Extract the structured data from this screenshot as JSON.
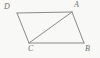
{
  "figure": {
    "type": "geometry-diagram",
    "shape": "parallelogram-with-diagonal",
    "background_color": "#f8f8f7",
    "stroke_color": "#8a8a8a",
    "label_color": "#6f6f6f",
    "stroke_width": 1,
    "width": 100,
    "height": 58,
    "vertices": [
      {
        "id": "D",
        "label": "D",
        "x": 17,
        "y": 13
      },
      {
        "id": "A",
        "label": "A",
        "x": 72,
        "y": 12
      },
      {
        "id": "B",
        "label": "B",
        "x": 84,
        "y": 43
      },
      {
        "id": "C",
        "label": "C",
        "x": 29,
        "y": 43
      }
    ],
    "edges": [
      {
        "id": "DA",
        "from": "D",
        "to": "A",
        "kind": "side"
      },
      {
        "id": "AB",
        "from": "A",
        "to": "B",
        "kind": "side"
      },
      {
        "id": "BC",
        "from": "B",
        "to": "C",
        "kind": "side"
      },
      {
        "id": "CD",
        "from": "C",
        "to": "D",
        "kind": "side"
      },
      {
        "id": "AC",
        "from": "A",
        "to": "C",
        "kind": "diagonal"
      }
    ],
    "labels": {
      "D": "D",
      "A": "A",
      "B": "B",
      "C": "C"
    }
  }
}
